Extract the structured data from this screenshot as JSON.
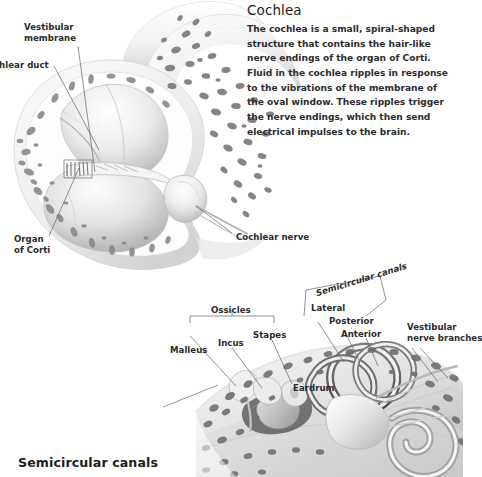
{
  "info_panel": {
    "title": "Cochlea",
    "body": "The cochlea is a small, spiral-shaped structure that contains the hair-like nerve endings of the organ of Corti. Fluid in the cochlea ripples in response to the vibrations of the membrane of the oval window. These ripples trigger the nerve endings, which then send electrical impulses to the brain."
  },
  "headings": {
    "semicircular_canals": "Semicircular canals"
  },
  "cochlea_labels": {
    "vestibular_membrane_line1": "Vestibular",
    "vestibular_membrane_line2": "membrane",
    "cochlear_duct": "chlear duct",
    "organ_of_corti_line1": "Organ",
    "organ_of_corti_line2": "of Corti",
    "cochlear_nerve": "Cochlear nerve"
  },
  "ear_labels": {
    "ossicles": "Ossicles",
    "malleus": "Malleus",
    "incus": "Incus",
    "stapes": "Stapes",
    "eardrum": "Eardrum",
    "semicircular_canals": "Semicircular canals",
    "lateral": "Lateral",
    "posterior": "Posterior",
    "anterior": "Anterior",
    "vestibular_nerve_line1": "Vestibular",
    "vestibular_nerve_line2": "nerve branches"
  },
  "colors": {
    "background": "#ffffff",
    "text": "#2b2b2b",
    "heading": "#1d1d1d",
    "leader_line": "#6e6e6e",
    "bone_blob": "#8a8a8a",
    "bone_blob_dark": "#5d5d5d",
    "tissue_light": "#efefef",
    "tissue_mid": "#c9c9c9",
    "tissue_dark": "#9a9a9a"
  }
}
